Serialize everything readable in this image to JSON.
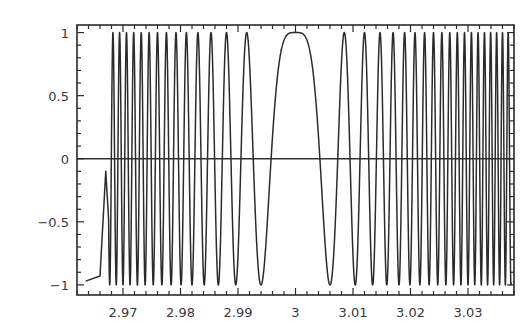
{
  "chart_data": {
    "type": "line",
    "title": "",
    "xlabel": "",
    "ylabel": "",
    "xlim": [
      2.962,
      3.038
    ],
    "ylim": [
      -1.08,
      1.06
    ],
    "grid": false,
    "legend": null,
    "x_ticks": [
      2.97,
      2.98,
      2.99,
      3,
      3.01,
      3.02,
      3.03
    ],
    "x_tick_labels": [
      "2.97",
      "2.98",
      "2.99",
      "3",
      "3.01",
      "3.02",
      "3.03"
    ],
    "y_ticks": [
      -1,
      -0.5,
      0,
      0.5,
      1
    ],
    "y_tick_labels": [
      "-1",
      "-0.5",
      "0",
      "0.5",
      "1"
    ],
    "reference_lines": [
      {
        "orientation": "horizontal",
        "y": 0
      }
    ],
    "series": [
      {
        "name": "cos(k (x-3)^2)",
        "description": "Chirp: cosine of a quadratic phase centered at x=3, with k ≈ 87270 (first zero-phase minimum at |x-3|≈0.006). Broad peak of value 1 at x=3, oscillations become faster away from the center. Left start shows an undersampling artifact: curve begins near y≈-0.97 at x≈2.9635, ramps to ≈-0.93 at x≈2.966, jumps to ≈-0.1 at x≈2.967, then full-amplitude oscillations.",
        "function": {
          "form": "cos(k*(x-x0)^2)",
          "k": 87270,
          "x0": 3.0
        },
        "x_start": 2.9635,
        "x_end": 3.0375,
        "sample_points": [
          {
            "x": 2.9635,
            "y": -0.97
          },
          {
            "x": 2.966,
            "y": -0.93
          },
          {
            "x": 2.967,
            "y": -0.1
          },
          {
            "x": 2.9915,
            "y": 1.0
          },
          {
            "x": 2.994,
            "y": -1.0
          },
          {
            "x": 2.997,
            "y": 0.0
          },
          {
            "x": 3.0,
            "y": 1.0
          },
          {
            "x": 3.003,
            "y": 0.0
          },
          {
            "x": 3.006,
            "y": -1.0
          },
          {
            "x": 3.0085,
            "y": 1.0
          }
        ]
      }
    ]
  },
  "plot_area_px": {
    "left": 77,
    "top": 25,
    "right": 514,
    "bottom": 295
  },
  "colors": {
    "line": "#2b2b2b",
    "frame": "#2a2a2a",
    "background": "#ffffff",
    "text": "#3a3a3a"
  }
}
